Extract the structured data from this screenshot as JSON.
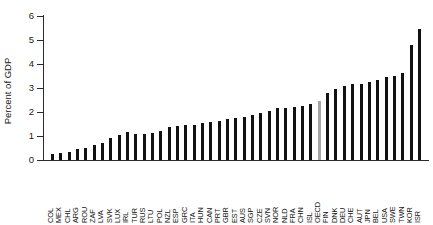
{
  "chart_data": {
    "type": "bar",
    "title": "",
    "subtitle": "",
    "xlabel": "",
    "ylabel": "Percent of GDP",
    "ylim": [
      0,
      6
    ],
    "yticks": [
      0,
      1,
      2,
      3,
      4,
      5,
      6
    ],
    "ytick_labels": [
      "0",
      "1",
      "2",
      "3",
      "4",
      "5",
      "6"
    ],
    "grid": false,
    "legend": null,
    "bar_color": "#111111",
    "highlight_color": "#a6a6a6",
    "highlight_category": "OECD",
    "categories": [
      "COL",
      "MEX",
      "CHL",
      "ARG",
      "ROU",
      "ZAF",
      "LVA",
      "SVK",
      "LUX",
      "IRL",
      "TUR",
      "RUS",
      "LTU",
      "POL",
      "NZL",
      "ESP",
      "GRC",
      "ITA",
      "HUN",
      "CAN",
      "PRT",
      "GBR",
      "EST",
      "AUS",
      "SGP",
      "CZE",
      "SVN",
      "NOR",
      "NLD",
      "FRA",
      "CHN",
      "ISL",
      "OECD",
      "FIN",
      "DNK",
      "DEU",
      "CHE",
      "AUT",
      "JPN",
      "BEL",
      "USA",
      "SWE",
      "TWN",
      "KOR",
      "ISR"
    ],
    "values": [
      0.25,
      0.3,
      0.34,
      0.46,
      0.48,
      0.62,
      0.7,
      0.9,
      1.04,
      1.15,
      1.09,
      1.1,
      1.14,
      1.21,
      1.37,
      1.41,
      1.47,
      1.45,
      1.53,
      1.59,
      1.62,
      1.71,
      1.75,
      1.79,
      1.89,
      1.94,
      2.04,
      2.15,
      2.18,
      2.19,
      2.23,
      2.35,
      2.47,
      2.79,
      2.96,
      3.09,
      3.15,
      3.17,
      3.26,
      3.35,
      3.45,
      3.52,
      3.63,
      4.81,
      5.44
    ],
    "units": "Percent of GDP"
  }
}
